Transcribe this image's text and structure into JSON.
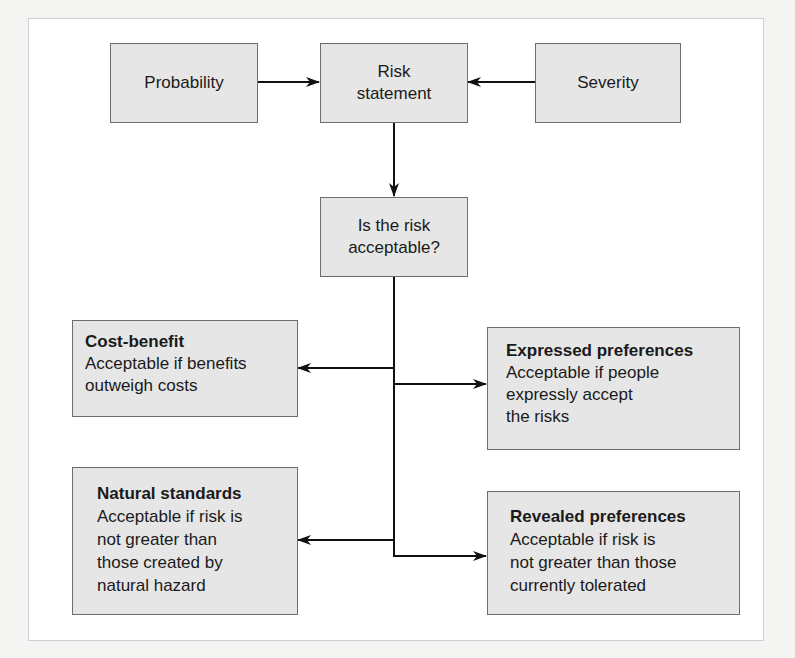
{
  "diagram": {
    "nodes": {
      "probability": {
        "label": "Probability"
      },
      "risk_statement": {
        "lines": [
          "Risk",
          "statement"
        ]
      },
      "severity": {
        "label": "Severity"
      },
      "acceptable_question": {
        "lines": [
          "Is the risk",
          "acceptable?"
        ]
      },
      "cost_benefit": {
        "title": "Cost-benefit",
        "lines": [
          "Acceptable if benefits",
          "outweigh costs"
        ]
      },
      "expressed_preferences": {
        "title": "Expressed preferences",
        "lines": [
          "Acceptable if people",
          "expressly accept",
          "the risks"
        ]
      },
      "natural_standards": {
        "title": "Natural standards",
        "lines": [
          "Acceptable if risk is",
          "not greater than",
          "those created by",
          "natural hazard"
        ]
      },
      "revealed_preferences": {
        "title": "Revealed preferences",
        "lines": [
          "Acceptable if risk is",
          "not greater than those",
          "currently tolerated"
        ]
      }
    },
    "edges": [
      {
        "from": "probability",
        "to": "risk_statement"
      },
      {
        "from": "severity",
        "to": "risk_statement"
      },
      {
        "from": "risk_statement",
        "to": "acceptable_question"
      },
      {
        "from": "acceptable_question",
        "to": "cost_benefit"
      },
      {
        "from": "acceptable_question",
        "to": "expressed_preferences"
      },
      {
        "from": "acceptable_question",
        "to": "natural_standards"
      },
      {
        "from": "acceptable_question",
        "to": "revealed_preferences"
      }
    ],
    "colors": {
      "box_fill": "#e6e6e6",
      "box_border": "#6e6e6e",
      "line": "#111111"
    }
  }
}
